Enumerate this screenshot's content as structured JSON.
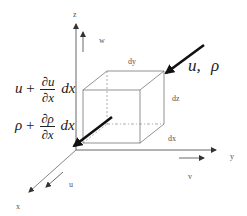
{
  "diagram": {
    "type": "control-volume-cube",
    "axes": {
      "z": "z",
      "y": "y",
      "x": "x"
    },
    "velocity_components": {
      "w": "w",
      "v": "v",
      "u": "u"
    },
    "cube_dimensions": {
      "dy": "dy",
      "dz": "dz",
      "dx": "dx"
    },
    "inflow_label": {
      "u": "u,",
      "rho": "ρ"
    },
    "outflow_velocity": {
      "base": "u",
      "plus": "+",
      "num": "∂u",
      "den": "∂x",
      "tail": "dx"
    },
    "outflow_density": {
      "base": "ρ",
      "plus": "+",
      "num": "∂ρ",
      "den": "∂x",
      "tail": "dx"
    },
    "colors": {
      "axis": "#666666",
      "cube": "#777777",
      "flow_arrow": "#111111",
      "text": "#222222"
    }
  }
}
